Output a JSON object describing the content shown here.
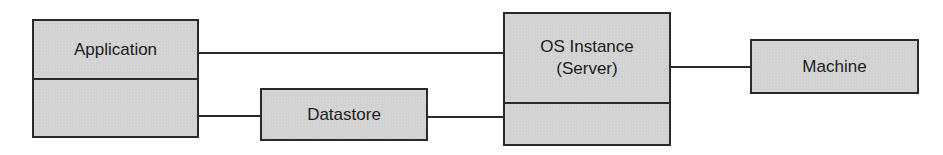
{
  "diagram": {
    "type": "component-relationship",
    "colors": {
      "box_fill": "#d2d2d2",
      "border": "#2a2a2a",
      "text": "#1c1c1c",
      "background": "#ffffff"
    },
    "nodes": [
      {
        "id": "application",
        "label": "Application",
        "lower_label": ""
      },
      {
        "id": "datastore",
        "label": "Datastore"
      },
      {
        "id": "os_instance",
        "label_line1": "OS Instance",
        "label_line2": "(Server)",
        "lower_label": ""
      },
      {
        "id": "machine",
        "label": "Machine"
      }
    ],
    "edges": [
      {
        "from": "application",
        "to": "os_instance"
      },
      {
        "from": "application",
        "to": "datastore"
      },
      {
        "from": "datastore",
        "to": "os_instance"
      },
      {
        "from": "os_instance",
        "to": "machine"
      }
    ]
  }
}
